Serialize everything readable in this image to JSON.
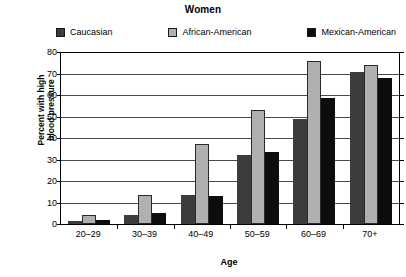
{
  "chart_data": {
    "type": "bar",
    "title": "Women",
    "xlabel": "Age",
    "ylabel": "Percent with high blood pressure",
    "ylabel_lines": [
      "Percent with high",
      "blood pressure"
    ],
    "categories": [
      "20–29",
      "30–39",
      "40–49",
      "50–59",
      "60–69",
      "70+"
    ],
    "series": [
      {
        "name": "Caucasian",
        "color": "#3c3c3c",
        "values": [
          1.5,
          4,
          13.5,
          32,
          49,
          70.5
        ]
      },
      {
        "name": "African-American",
        "color": "#b0b0b0",
        "values": [
          4,
          13.5,
          37,
          53,
          76,
          74
        ]
      },
      {
        "name": "Mexican-American",
        "color": "#0d0d0d",
        "values": [
          2,
          5,
          13,
          33.5,
          58.5,
          68
        ]
      }
    ],
    "ylim": [
      0,
      80
    ],
    "yticks": [
      0,
      10,
      20,
      30,
      40,
      50,
      60,
      70,
      80
    ],
    "ytick_labels": [
      "0",
      "10",
      "20",
      "30",
      "40",
      "50",
      "60",
      "70",
      "80"
    ],
    "grid": true,
    "legend_position": "top"
  }
}
